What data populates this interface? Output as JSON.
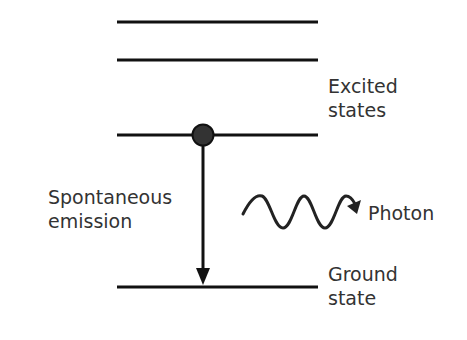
{
  "diagram": {
    "type": "energy-level-diagram",
    "labels": {
      "excited_line1": "Excited",
      "excited_line2": "states",
      "process_line1": "Spontaneous",
      "process_line2": "emission",
      "photon": "Photon",
      "ground_line1": "Ground",
      "ground_line2": "state"
    },
    "levels": [
      {
        "name": "excited-level-3",
        "y": 22
      },
      {
        "name": "excited-level-2",
        "y": 60
      },
      {
        "name": "excited-level-1",
        "y": 135
      },
      {
        "name": "ground-level",
        "y": 287
      }
    ],
    "colors": {
      "line": "#111111",
      "text": "#333333",
      "electron_fill": "#333333"
    }
  }
}
